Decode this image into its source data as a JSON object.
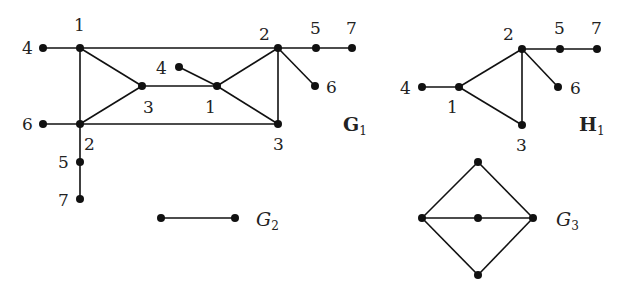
{
  "graphs": [
    {
      "id": "G1",
      "label": "G",
      "subscript": "1",
      "label_style": "bold",
      "label_pos": [
        343,
        131
      ],
      "vertices": [
        {
          "id": "a4",
          "label": "4",
          "x": 43,
          "y": 48,
          "lx": 22,
          "ly": 54
        },
        {
          "id": "a1",
          "label": "1",
          "x": 80,
          "y": 48,
          "lx": 74,
          "ly": 31
        },
        {
          "id": "a3",
          "label": "3",
          "x": 142,
          "y": 86,
          "lx": 143,
          "ly": 113
        },
        {
          "id": "a6",
          "label": "6",
          "x": 43,
          "y": 124,
          "lx": 22,
          "ly": 130
        },
        {
          "id": "a2",
          "label": "2",
          "x": 80,
          "y": 124,
          "lx": 84,
          "ly": 150
        },
        {
          "id": "a5",
          "label": "5",
          "x": 80,
          "y": 162,
          "lx": 58,
          "ly": 168
        },
        {
          "id": "a7",
          "label": "7",
          "x": 80,
          "y": 199,
          "lx": 58,
          "ly": 206
        },
        {
          "id": "b4",
          "label": "4",
          "x": 179,
          "y": 67,
          "lx": 156,
          "ly": 74
        },
        {
          "id": "b1",
          "label": "1",
          "x": 217,
          "y": 86,
          "lx": 205,
          "ly": 113
        },
        {
          "id": "b2",
          "label": "2",
          "x": 278,
          "y": 48,
          "lx": 259,
          "ly": 40
        },
        {
          "id": "b5",
          "label": "5",
          "x": 316,
          "y": 48,
          "lx": 310,
          "ly": 34
        },
        {
          "id": "b7",
          "label": "7",
          "x": 352,
          "y": 48,
          "lx": 346,
          "ly": 34
        },
        {
          "id": "b6",
          "label": "6",
          "x": 315,
          "y": 86,
          "lx": 326,
          "ly": 93
        },
        {
          "id": "b3",
          "label": "3",
          "x": 278,
          "y": 124,
          "lx": 273,
          "ly": 150
        }
      ],
      "edges": [
        [
          "a4",
          "a1"
        ],
        [
          "a1",
          "b2"
        ],
        [
          "a1",
          "a3"
        ],
        [
          "a1",
          "a2"
        ],
        [
          "a3",
          "a2"
        ],
        [
          "a6",
          "a2"
        ],
        [
          "a2",
          "b3"
        ],
        [
          "a2",
          "a5"
        ],
        [
          "a5",
          "a7"
        ],
        [
          "a3",
          "b1"
        ],
        [
          "b4",
          "b1"
        ],
        [
          "b1",
          "b2"
        ],
        [
          "b1",
          "b3"
        ],
        [
          "b2",
          "b3"
        ],
        [
          "b2",
          "b5"
        ],
        [
          "b5",
          "b7"
        ],
        [
          "b2",
          "b6"
        ]
      ]
    },
    {
      "id": "H1",
      "label": "H",
      "subscript": "1",
      "label_style": "bold",
      "label_pos": [
        579,
        131
      ],
      "vertices": [
        {
          "id": "h4",
          "label": "4",
          "x": 422,
          "y": 87,
          "lx": 400,
          "ly": 94
        },
        {
          "id": "h1",
          "label": "1",
          "x": 459,
          "y": 87,
          "lx": 447,
          "ly": 113
        },
        {
          "id": "h2",
          "label": "2",
          "x": 522,
          "y": 49,
          "lx": 503,
          "ly": 40
        },
        {
          "id": "h5",
          "label": "5",
          "x": 560,
          "y": 49,
          "lx": 554,
          "ly": 34
        },
        {
          "id": "h7",
          "label": "7",
          "x": 597,
          "y": 49,
          "lx": 591,
          "ly": 34
        },
        {
          "id": "h6",
          "label": "6",
          "x": 558,
          "y": 87,
          "lx": 570,
          "ly": 94
        },
        {
          "id": "h3",
          "label": "3",
          "x": 522,
          "y": 125,
          "lx": 516,
          "ly": 151
        }
      ],
      "edges": [
        [
          "h4",
          "h1"
        ],
        [
          "h1",
          "h2"
        ],
        [
          "h1",
          "h3"
        ],
        [
          "h2",
          "h3"
        ],
        [
          "h2",
          "h5"
        ],
        [
          "h5",
          "h7"
        ],
        [
          "h2",
          "h6"
        ]
      ]
    },
    {
      "id": "G2",
      "label": "G",
      "subscript": "2",
      "label_style": "italic",
      "label_pos": [
        256,
        226
      ],
      "vertices": [
        {
          "id": "g2a",
          "label": "",
          "x": 161,
          "y": 218
        },
        {
          "id": "g2b",
          "label": "",
          "x": 235,
          "y": 218
        }
      ],
      "edges": [
        [
          "g2a",
          "g2b"
        ]
      ]
    },
    {
      "id": "G3",
      "label": "G",
      "subscript": "3",
      "label_style": "italic",
      "label_pos": [
        556,
        226
      ],
      "vertices": [
        {
          "id": "g3t",
          "label": "",
          "x": 478,
          "y": 162
        },
        {
          "id": "g3l",
          "label": "",
          "x": 422,
          "y": 218
        },
        {
          "id": "g3c",
          "label": "",
          "x": 478,
          "y": 218
        },
        {
          "id": "g3r",
          "label": "",
          "x": 533,
          "y": 218
        },
        {
          "id": "g3b",
          "label": "",
          "x": 478,
          "y": 275
        }
      ],
      "edges": [
        [
          "g3t",
          "g3l"
        ],
        [
          "g3t",
          "g3r"
        ],
        [
          "g3l",
          "g3b"
        ],
        [
          "g3r",
          "g3b"
        ],
        [
          "g3l",
          "g3c"
        ],
        [
          "g3c",
          "g3r"
        ]
      ]
    }
  ]
}
